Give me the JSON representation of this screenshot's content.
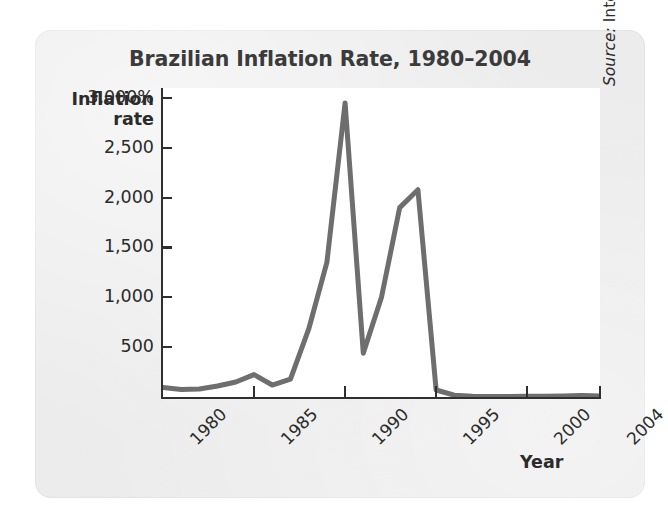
{
  "figure": {
    "title": "Brazilian Inflation Rate, 1980–2004",
    "source_keyword": "Source:",
    "source_body": " International Monetary Fund.",
    "source_full": "Source: International Monetary Fund.",
    "panel_color": "#ececec",
    "plot_bg_color": "#ffffff",
    "line_color": "#6e6e6e",
    "axis_color": "#2f2f2f",
    "text_color": "#2b2b2b",
    "title_color": "#3b3b3b"
  },
  "chart_data": {
    "type": "line",
    "title": "Brazilian Inflation Rate, 1980–2004",
    "xlabel": "Year",
    "ylabel": "Inflation rate",
    "ylabel_lines": [
      "Inflation",
      "rate"
    ],
    "grid": false,
    "legend": null,
    "xlim": [
      1980,
      2004
    ],
    "ylim": [
      0,
      3100
    ],
    "xticks": [
      1980,
      1985,
      1990,
      1995,
      2000,
      2004
    ],
    "xtick_labels": [
      "1980",
      "1985",
      "1990",
      "1995",
      "2000",
      "2004"
    ],
    "xtick_rotation": -45,
    "yticks": [
      500,
      1000,
      1500,
      2000,
      2500,
      3000
    ],
    "ytick_labels": [
      "500",
      "1,000",
      "1,500",
      "2,000",
      "2,500",
      "3,000%"
    ],
    "y_unit": "%",
    "series": [
      {
        "name": "Brazilian inflation rate",
        "color": "#6e6e6e",
        "line_width_px": 5,
        "x": [
          1980,
          1981,
          1982,
          1983,
          1984,
          1985,
          1986,
          1987,
          1988,
          1989,
          1990,
          1991,
          1992,
          1993,
          1994,
          1995,
          1996,
          1997,
          1998,
          1999,
          2000,
          2001,
          2002,
          2003,
          2004
        ],
        "values": [
          95,
          75,
          80,
          110,
          150,
          225,
          120,
          180,
          680,
          1350,
          2950,
          440,
          1000,
          1900,
          2080,
          70,
          18,
          8,
          5,
          6,
          8,
          7,
          10,
          15,
          10
        ]
      }
    ],
    "annotations": [
      {
        "label": "peak 1990",
        "x": 1990,
        "y": 2950
      },
      {
        "label": "trough 1991",
        "x": 1991,
        "y": 440
      },
      {
        "label": "peak 1994",
        "x": 1994,
        "y": 2080
      }
    ]
  },
  "axes_geometry": {
    "plot_left_px": 163,
    "plot_top_px": 88,
    "plot_width_px": 437,
    "plot_height_px": 309,
    "x_per_year_px": 18,
    "y_px_per_500": 39.6
  }
}
